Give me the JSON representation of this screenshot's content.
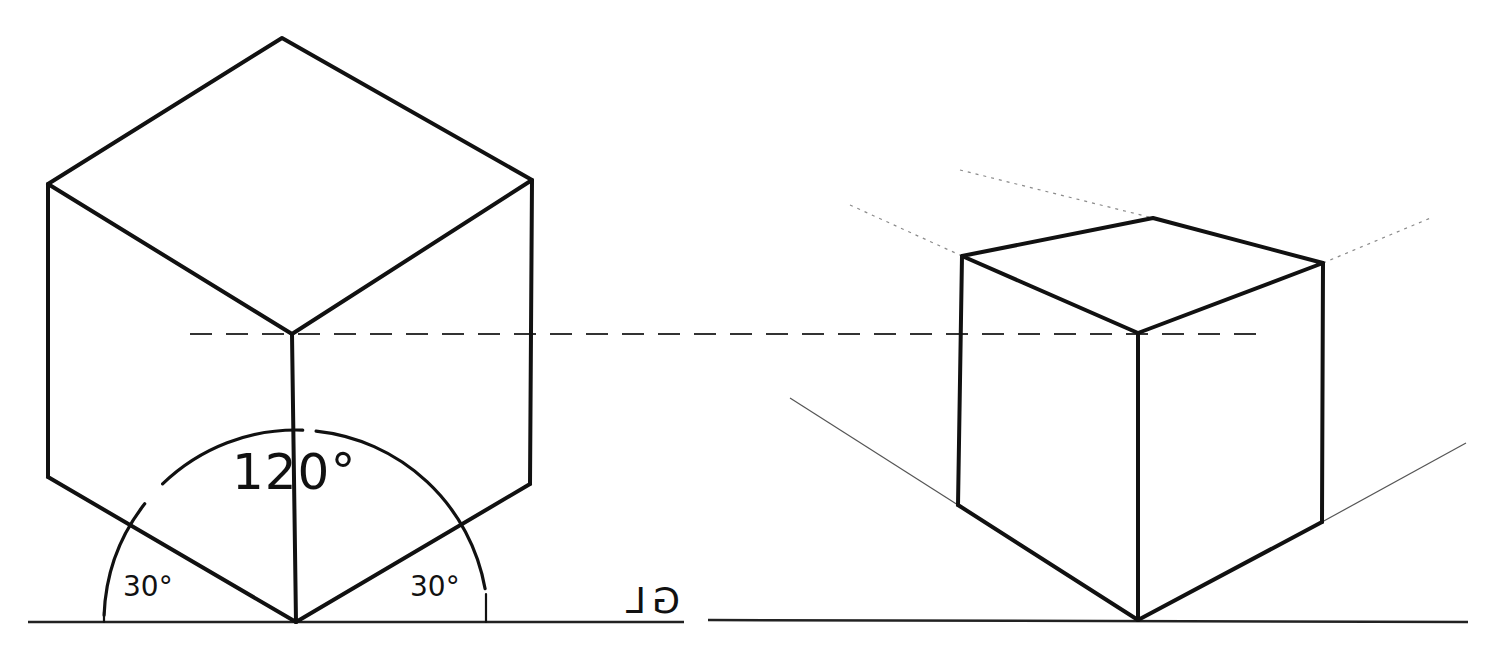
{
  "diagram": {
    "left_figure": {
      "name": "isometric-cube",
      "vertices": {
        "top": [
          282,
          38
        ],
        "upper_left": [
          48,
          184
        ],
        "upper_right": [
          532,
          180
        ],
        "front_top": [
          292,
          334
        ],
        "bottom": [
          296,
          622
        ],
        "lower_left": [
          48,
          477
        ],
        "lower_right": [
          530,
          484
        ]
      },
      "angle_labels": {
        "center": "120°",
        "left": "30°",
        "right": "30°"
      },
      "arc": {
        "center": [
          296,
          622
        ],
        "radius": 192
      }
    },
    "right_figure": {
      "name": "two-point-perspective-cube",
      "vertices": {
        "top_back": [
          1153,
          218
        ],
        "top_left": [
          962,
          256
        ],
        "top_right": [
          1323,
          263
        ],
        "front_top": [
          1138,
          333
        ],
        "bottom": [
          1138,
          620
        ],
        "bottom_left": [
          958,
          505
        ],
        "bottom_right": [
          1322,
          522
        ]
      },
      "construction_lines": {
        "left_lower": [
          [
            790,
            398
          ],
          [
            958,
            505
          ]
        ],
        "right_lower": [
          [
            1322,
            522
          ],
          [
            1466,
            443
          ]
        ],
        "left_upper": [
          [
            850,
            205
          ],
          [
            962,
            256
          ]
        ],
        "right_upper": [
          [
            1323,
            263
          ],
          [
            1433,
            217
          ]
        ],
        "back_top": [
          [
            960,
            170
          ],
          [
            1153,
            218
          ]
        ]
      }
    },
    "ground_line": {
      "label": "GL",
      "left_segment": [
        [
          28,
          622
        ],
        [
          684,
          622
        ]
      ],
      "right_segment": [
        [
          708,
          620
        ],
        [
          1468,
          622
        ]
      ]
    },
    "eye_level_line": [
      [
        190,
        334
      ],
      [
        1260,
        334
      ]
    ],
    "colors": {
      "ink": "#111111",
      "paper": "#ffffff",
      "construction": "#8a8a8a"
    }
  }
}
